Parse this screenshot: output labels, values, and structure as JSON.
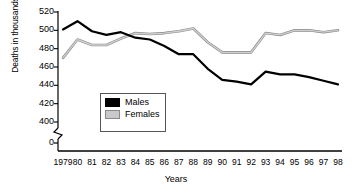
{
  "chart_data": {
    "type": "line",
    "title": "",
    "xlabel": "Years",
    "ylabel": "Deaths in thousands",
    "categories": [
      "1979",
      "80",
      "81",
      "82",
      "83",
      "84",
      "85",
      "86",
      "87",
      "88",
      "89",
      "90",
      "91",
      "92",
      "93",
      "94",
      "95",
      "96",
      "97",
      "98"
    ],
    "yticks": [
      520,
      500,
      480,
      460,
      440,
      420,
      400,
      0
    ],
    "ylim": [
      400,
      520
    ],
    "axis_break": true,
    "grid": false,
    "legend_position": "inside-lower-left",
    "series": [
      {
        "name": "Males",
        "color": "#000000",
        "values": [
          501,
          510,
          499,
          495,
          498,
          492,
          490,
          483,
          474,
          474,
          458,
          446,
          444,
          441,
          455,
          452,
          452,
          449,
          445,
          441
        ]
      },
      {
        "name": "Females",
        "color": "#c9c9c9",
        "values": [
          470,
          490,
          484,
          484,
          491,
          497,
          496,
          497,
          499,
          502,
          487,
          476,
          476,
          476,
          497,
          495,
          500,
          500,
          498,
          500
        ]
      }
    ]
  },
  "legend": {
    "males_label": "Males",
    "females_label": "Females"
  },
  "axes": {
    "y_title": "Deaths in thousands",
    "x_title": "Years"
  }
}
